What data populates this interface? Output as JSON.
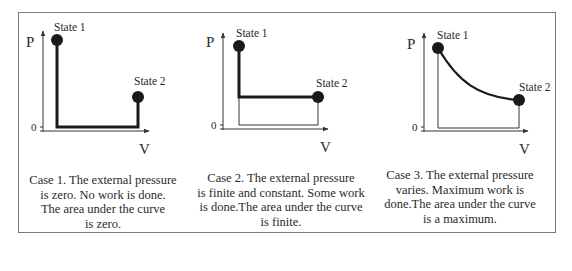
{
  "panels": [
    {
      "id": "case1",
      "title": "Case 1",
      "axes": {
        "y_label": "P",
        "x_label": "V",
        "origin_label": "0"
      },
      "states": {
        "start": "State 1",
        "end": "State 2"
      },
      "path": "vertical drop to zero pressure, horizontal expansion at P=0, vertical rise to State 2",
      "caption_lines": [
        "Case 1. The external pressure",
        "is zero. No work is done.",
        "The area under the curve",
        "is zero."
      ]
    },
    {
      "id": "case2",
      "title": "Case 2",
      "axes": {
        "y_label": "P",
        "x_label": "V",
        "origin_label": "0"
      },
      "states": {
        "start": "State 1",
        "end": "State 2"
      },
      "path": "vertical drop to constant finite pressure, horizontal expansion to State 2",
      "caption_lines": [
        "Case 2. The external pressure",
        "is finite and constant. Some work",
        "is done.The area under the curve",
        "is finite."
      ]
    },
    {
      "id": "case3",
      "title": "Case 3",
      "axes": {
        "y_label": "P",
        "x_label": "V",
        "origin_label": "0"
      },
      "states": {
        "start": "State 1",
        "end": "State 2"
      },
      "path": "smooth decreasing curve from State 1 to State 2",
      "caption_lines": [
        "Case 3. The external pressure",
        "varies. Maximum work is",
        "done.The area under the curve",
        "is a maximum."
      ]
    }
  ],
  "colors": {
    "line": "#1a1a1a",
    "thin_line": "#333333",
    "frame": "#7a7a7a",
    "text": "#2a2a2a"
  }
}
